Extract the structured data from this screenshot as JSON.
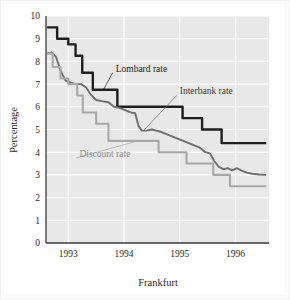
{
  "chart_data": {
    "type": "line",
    "title": "",
    "xlabel": "Frankfurt",
    "ylabel": "Percentage",
    "xlim": [
      1992.6,
      1996.6
    ],
    "ylim": [
      0,
      10
    ],
    "yticks": [
      0,
      1,
      2,
      3,
      4,
      5,
      6,
      7,
      8,
      9,
      10
    ],
    "xticks": [
      1993,
      1994,
      1995,
      1996
    ],
    "xtick_labels": [
      "1993",
      "1994",
      "1995",
      "1996"
    ],
    "grid": true,
    "grid_color": "#ffffff",
    "plot_bg": "#e8e8e8",
    "legend": "inline-annotations",
    "series": [
      {
        "name": "Lombard rate",
        "color": "#1f1f1f",
        "width": 2.4,
        "style": "step",
        "label_pos": {
          "x": 1993.85,
          "y": 7.55
        },
        "leader_to": {
          "x": 1993.63,
          "y": 6.75
        },
        "points": [
          [
            1992.62,
            9.5
          ],
          [
            1992.8,
            9.5
          ],
          [
            1992.8,
            9.0
          ],
          [
            1993.0,
            9.0
          ],
          [
            1993.0,
            8.75
          ],
          [
            1993.13,
            8.75
          ],
          [
            1993.13,
            8.25
          ],
          [
            1993.25,
            8.25
          ],
          [
            1993.25,
            7.5
          ],
          [
            1993.44,
            7.5
          ],
          [
            1993.44,
            6.75
          ],
          [
            1993.88,
            6.75
          ],
          [
            1993.88,
            6.0
          ],
          [
            1995.05,
            6.0
          ],
          [
            1995.05,
            5.5
          ],
          [
            1995.4,
            5.5
          ],
          [
            1995.4,
            5.0
          ],
          [
            1995.75,
            5.0
          ],
          [
            1995.75,
            4.4
          ],
          [
            1996.55,
            4.4
          ]
        ]
      },
      {
        "name": "Interbank rate",
        "color": "#6e6e6e",
        "width": 1.9,
        "style": "line",
        "label_pos": {
          "x": 1995.0,
          "y": 6.55
        },
        "leader_to": {
          "x": 1994.35,
          "y": 4.95
        },
        "points": [
          [
            1992.62,
            8.35
          ],
          [
            1992.7,
            8.4
          ],
          [
            1992.78,
            8.2
          ],
          [
            1992.86,
            7.6
          ],
          [
            1992.95,
            7.15
          ],
          [
            1993.05,
            7.05
          ],
          [
            1993.14,
            7.0
          ],
          [
            1993.23,
            7.0
          ],
          [
            1993.32,
            6.85
          ],
          [
            1993.4,
            6.55
          ],
          [
            1993.5,
            6.3
          ],
          [
            1993.6,
            6.25
          ],
          [
            1993.72,
            6.2
          ],
          [
            1993.82,
            6.0
          ],
          [
            1993.92,
            5.95
          ],
          [
            1994.02,
            5.85
          ],
          [
            1994.12,
            5.75
          ],
          [
            1994.2,
            5.72
          ],
          [
            1994.26,
            5.15
          ],
          [
            1994.32,
            4.95
          ],
          [
            1994.4,
            4.95
          ],
          [
            1994.5,
            5.0
          ],
          [
            1994.58,
            4.95
          ],
          [
            1994.66,
            4.9
          ],
          [
            1994.76,
            4.8
          ],
          [
            1994.86,
            4.7
          ],
          [
            1994.96,
            4.6
          ],
          [
            1995.06,
            4.5
          ],
          [
            1995.16,
            4.4
          ],
          [
            1995.26,
            4.3
          ],
          [
            1995.36,
            4.2
          ],
          [
            1995.46,
            4.0
          ],
          [
            1995.54,
            3.95
          ],
          [
            1995.62,
            3.6
          ],
          [
            1995.7,
            3.35
          ],
          [
            1995.78,
            3.25
          ],
          [
            1995.86,
            3.3
          ],
          [
            1995.94,
            3.2
          ],
          [
            1996.02,
            3.3
          ],
          [
            1996.1,
            3.2
          ],
          [
            1996.2,
            3.1
          ],
          [
            1996.3,
            3.05
          ],
          [
            1996.42,
            3.02
          ],
          [
            1996.55,
            3.0
          ]
        ]
      },
      {
        "name": "Discount rate",
        "color": "#a8a8a8",
        "width": 2.1,
        "style": "step",
        "label_pos": {
          "x": 1993.2,
          "y": 3.8
        },
        "leader_to": {
          "x": 1994.18,
          "y": 4.45
        },
        "points": [
          [
            1992.62,
            8.35
          ],
          [
            1992.72,
            8.35
          ],
          [
            1992.72,
            7.75
          ],
          [
            1992.86,
            7.75
          ],
          [
            1992.86,
            7.25
          ],
          [
            1993.0,
            7.25
          ],
          [
            1993.0,
            7.0
          ],
          [
            1993.16,
            7.0
          ],
          [
            1993.16,
            6.5
          ],
          [
            1993.26,
            6.5
          ],
          [
            1993.26,
            5.75
          ],
          [
            1993.5,
            5.75
          ],
          [
            1993.5,
            5.25
          ],
          [
            1993.64,
            5.25
          ],
          [
            1993.64,
            5.25
          ],
          [
            1993.72,
            5.25
          ],
          [
            1993.72,
            4.5
          ],
          [
            1994.62,
            4.5
          ],
          [
            1994.62,
            4.0
          ],
          [
            1995.12,
            4.0
          ],
          [
            1995.12,
            3.5
          ],
          [
            1995.6,
            3.5
          ],
          [
            1995.6,
            3.0
          ],
          [
            1995.9,
            3.0
          ],
          [
            1995.9,
            2.5
          ],
          [
            1996.55,
            2.5
          ]
        ]
      }
    ]
  }
}
